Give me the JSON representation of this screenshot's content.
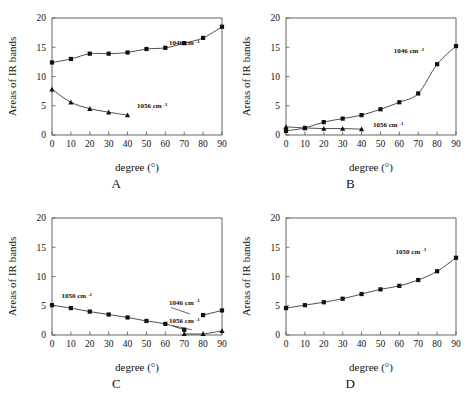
{
  "figure": {
    "ghost_text": "",
    "panels": [
      {
        "letter": "A"
      },
      {
        "letter": "B"
      },
      {
        "letter": "C"
      },
      {
        "letter": "D"
      }
    ]
  },
  "axes": {
    "xlabel": "degree (°)",
    "ylabel": "Areas of IR bands",
    "xticks": [
      0,
      10,
      20,
      30,
      40,
      50,
      60,
      70,
      80,
      90
    ],
    "yticks": [
      0,
      5,
      10,
      15,
      20
    ],
    "xlim": [
      0,
      90
    ],
    "ylim": [
      0,
      20
    ]
  },
  "chart_data": [
    {
      "type": "line",
      "panel": "A",
      "title": "A",
      "xlabel": "degree (°)",
      "ylabel": "Areas of IR bands",
      "xlim": [
        0,
        90
      ],
      "ylim": [
        0,
        20
      ],
      "xticks": [
        0,
        10,
        20,
        30,
        40,
        50,
        60,
        70,
        80,
        90
      ],
      "yticks": [
        0,
        5,
        10,
        15,
        20
      ],
      "grid": false,
      "legend": "inline-annotation",
      "series": [
        {
          "name": "1046 cm-1",
          "label": "1046 cm",
          "label_sup": "-1",
          "marker": "square",
          "x": [
            0,
            10,
            20,
            30,
            40,
            50,
            60,
            70,
            80,
            90
          ],
          "values": [
            12.4,
            13.0,
            13.9,
            13.9,
            14.1,
            14.7,
            14.9,
            15.7,
            16.6,
            18.5
          ]
        },
        {
          "name": "1056 cm-1",
          "label": "1056 cm",
          "label_sup": "-1",
          "marker": "triangle",
          "x": [
            0,
            10,
            20,
            30,
            40
          ],
          "values": [
            7.8,
            5.6,
            4.5,
            3.9,
            3.4
          ]
        }
      ]
    },
    {
      "type": "line",
      "panel": "B",
      "title": "B",
      "xlabel": "degree (°)",
      "ylabel": "Areas of IR bands",
      "xlim": [
        0,
        90
      ],
      "ylim": [
        0,
        20
      ],
      "xticks": [
        0,
        10,
        20,
        30,
        40,
        50,
        60,
        70,
        80,
        90
      ],
      "yticks": [
        0,
        5,
        10,
        15,
        20
      ],
      "grid": false,
      "legend": "inline-annotation",
      "series": [
        {
          "name": "1046 cm-1",
          "label": "1046 cm",
          "label_sup": "-1",
          "marker": "square",
          "x": [
            0,
            10,
            20,
            30,
            40,
            50,
            60,
            70,
            80,
            90
          ],
          "values": [
            0.7,
            1.2,
            2.2,
            2.8,
            3.4,
            4.4,
            5.6,
            7.1,
            12.1,
            15.2
          ]
        },
        {
          "name": "1056 cm-1",
          "label": "1056 cm",
          "label_sup": "-1",
          "marker": "triangle",
          "x": [
            0,
            10,
            20,
            30,
            40
          ],
          "values": [
            1.4,
            1.2,
            1.1,
            1.1,
            1.0
          ]
        }
      ]
    },
    {
      "type": "line",
      "panel": "C",
      "title": "C",
      "xlabel": "degree (°)",
      "ylabel": "Areas of IR bands",
      "xlim": [
        0,
        90
      ],
      "ylim": [
        0,
        20
      ],
      "xticks": [
        0,
        10,
        20,
        30,
        40,
        50,
        60,
        70,
        80,
        90
      ],
      "yticks": [
        0,
        5,
        10,
        15,
        20
      ],
      "grid": false,
      "legend": "inline-annotation",
      "series": [
        {
          "name": "1050 cm-1",
          "label": "1050 cm",
          "label_sup": "-1",
          "marker": "square",
          "x": [
            0,
            10,
            20,
            30,
            40,
            50,
            60,
            70
          ],
          "values": [
            5.1,
            4.6,
            4.0,
            3.5,
            3.0,
            2.4,
            1.9,
            0.9
          ]
        },
        {
          "name": "1046 cm-1",
          "label": "1046 cm",
          "label_sup": "-1",
          "marker": "square",
          "x": [
            80,
            90
          ],
          "values": [
            3.4,
            4.2
          ]
        },
        {
          "name": "1056 cm-1",
          "label": "1056 cm",
          "label_sup": "-1",
          "marker": "triangle",
          "x": [
            70,
            80,
            90
          ],
          "values": [
            0.2,
            0.2,
            0.7
          ]
        }
      ]
    },
    {
      "type": "line",
      "panel": "D",
      "title": "D",
      "xlabel": "degree (°)",
      "ylabel": "Areas of IR bands",
      "xlim": [
        0,
        90
      ],
      "ylim": [
        0,
        20
      ],
      "xticks": [
        0,
        10,
        20,
        30,
        40,
        50,
        60,
        70,
        80,
        90
      ],
      "yticks": [
        0,
        5,
        10,
        15,
        20
      ],
      "grid": false,
      "legend": "inline-annotation",
      "series": [
        {
          "name": "1050 cm-1",
          "label": "1050 cm",
          "label_sup": "-1",
          "marker": "square",
          "x": [
            0,
            10,
            20,
            30,
            40,
            50,
            60,
            70,
            80,
            90
          ],
          "values": [
            4.6,
            5.1,
            5.6,
            6.2,
            7.0,
            7.8,
            8.4,
            9.4,
            10.9,
            13.2
          ]
        }
      ]
    }
  ]
}
